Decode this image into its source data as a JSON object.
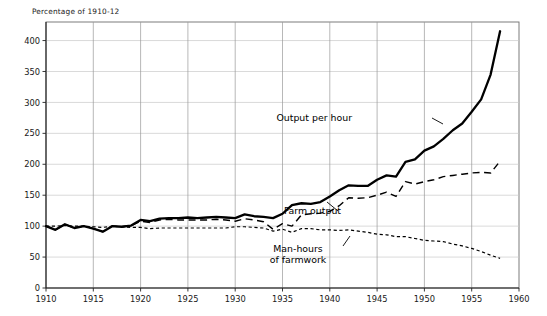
{
  "chart_data": {
    "type": "line",
    "title": "",
    "ylabel": "Percentage of 1910-12",
    "xlabel": "",
    "xlim": [
      1910,
      1960
    ],
    "ylim": [
      0,
      430
    ],
    "grid": true,
    "legend_position": "inline-annotations",
    "y_ticks": [
      0,
      50,
      100,
      150,
      200,
      250,
      300,
      350,
      400
    ],
    "x_ticks": [
      1910,
      1915,
      1920,
      1925,
      1930,
      1935,
      1940,
      1945,
      1950,
      1955,
      1960
    ],
    "x": [
      1910,
      1911,
      1912,
      1913,
      1914,
      1915,
      1916,
      1917,
      1918,
      1919,
      1920,
      1921,
      1922,
      1923,
      1924,
      1925,
      1926,
      1927,
      1928,
      1929,
      1930,
      1931,
      1932,
      1933,
      1934,
      1935,
      1936,
      1937,
      1938,
      1939,
      1940,
      1941,
      1942,
      1943,
      1944,
      1945,
      1946,
      1947,
      1948,
      1949,
      1950,
      1951,
      1952,
      1953,
      1954,
      1955,
      1956,
      1957,
      1958
    ],
    "series": [
      {
        "name": "Output per hour",
        "style": "solid",
        "values": [
          100,
          94,
          103,
          97,
          100,
          96,
          91,
          100,
          99,
          101,
          110,
          108,
          112,
          113,
          113,
          114,
          113,
          114,
          115,
          114,
          113,
          119,
          116,
          115,
          113,
          120,
          134,
          137,
          136,
          139,
          148,
          158,
          166,
          165,
          165,
          175,
          182,
          180,
          204,
          208,
          222,
          229,
          241,
          255,
          266,
          285,
          305,
          345,
          415
        ]
      },
      {
        "name": "Farm output",
        "style": "dashed",
        "values": [
          100,
          94,
          103,
          97,
          100,
          96,
          91,
          100,
          99,
          101,
          108,
          106,
          110,
          111,
          110,
          110,
          110,
          110,
          111,
          110,
          108,
          112,
          110,
          107,
          95,
          104,
          100,
          118,
          120,
          121,
          124,
          133,
          146,
          145,
          146,
          150,
          155,
          148,
          172,
          168,
          172,
          175,
          180,
          182,
          184,
          186,
          187,
          186,
          205
        ]
      },
      {
        "name": "Man-hours of farmwork",
        "style": "dotted",
        "values": [
          100,
          100,
          101,
          100,
          100,
          99,
          98,
          100,
          99,
          98,
          98,
          96,
          97,
          97,
          97,
          97,
          97,
          97,
          97,
          97,
          99,
          99,
          98,
          97,
          92,
          95,
          90,
          96,
          96,
          94,
          94,
          93,
          94,
          92,
          90,
          87,
          86,
          83,
          83,
          80,
          77,
          76,
          75,
          71,
          68,
          64,
          59,
          53,
          48
        ]
      }
    ],
    "annotations": [
      {
        "text": "Output per hour",
        "target_year": 1950,
        "target_value": 222,
        "label_x": 352,
        "label_y": 121,
        "leader": [
          [
            432,
            118
          ],
          [
            443,
            124
          ]
        ]
      },
      {
        "text": "Farm output",
        "target_year": 1942,
        "target_value": 146,
        "label_x": 341,
        "label_y": 214,
        "leader": [
          [
            338,
            211
          ],
          [
            327,
            202
          ]
        ]
      },
      {
        "text_line1": "Man-hours",
        "text_line2": "of farmwork",
        "target_year": 1944,
        "target_value": 90,
        "label_x": 298,
        "label_y": 252,
        "leader": [
          [
            343,
            246
          ],
          [
            350,
            236
          ]
        ]
      }
    ]
  },
  "geometry": {
    "plot_left": 46,
    "plot_right": 519,
    "plot_top": 22,
    "plot_bottom": 288
  }
}
